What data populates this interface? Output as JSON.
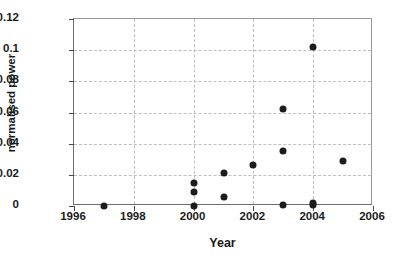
{
  "chart_data": {
    "type": "scatter",
    "title": "",
    "xlabel": "Year",
    "ylabel": "normalised power",
    "xlim": [
      1996,
      2006
    ],
    "ylim": [
      0,
      0.12
    ],
    "grid": true,
    "legend": "none",
    "xticks": [
      "1996",
      "1998",
      "2000",
      "2002",
      "2004",
      "2006"
    ],
    "xtick_values": [
      1996,
      1998,
      2000,
      2002,
      2004,
      2006
    ],
    "yticks": [
      "0",
      "0.02",
      "0.04",
      "0.06",
      "0.08",
      "0.1",
      "0.12"
    ],
    "ytick_values": [
      0,
      0.02,
      0.04,
      0.06,
      0.08,
      0.1,
      0.12
    ],
    "marker_color": "#1c1c1c",
    "points": [
      {
        "x": 1997,
        "y": 0.0
      },
      {
        "x": 2000,
        "y": 0.0
      },
      {
        "x": 2000,
        "y": 0.009
      },
      {
        "x": 2000,
        "y": 0.0145
      },
      {
        "x": 2001,
        "y": 0.006
      },
      {
        "x": 2001,
        "y": 0.021
      },
      {
        "x": 2002,
        "y": 0.026
      },
      {
        "x": 2003,
        "y": 0.0005
      },
      {
        "x": 2003,
        "y": 0.0355
      },
      {
        "x": 2003,
        "y": 0.0625
      },
      {
        "x": 2004,
        "y": 0.0005
      },
      {
        "x": 2004,
        "y": 0.0018
      },
      {
        "x": 2004,
        "y": 0.102
      },
      {
        "x": 2005,
        "y": 0.029
      }
    ]
  }
}
